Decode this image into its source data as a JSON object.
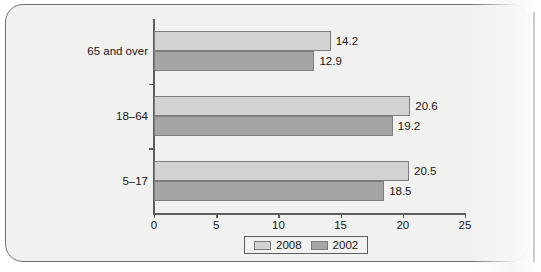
{
  "chart_data": {
    "type": "bar",
    "orientation": "horizontal",
    "title": "",
    "xlabel": "",
    "ylabel": "",
    "categories": [
      "65 and over",
      "18–64",
      "5–17"
    ],
    "series": [
      {
        "name": "2008",
        "values": [
          14.2,
          20.6,
          20.5
        ],
        "color": "#d2d2d0"
      },
      {
        "name": "2002",
        "values": [
          12.9,
          19.2,
          18.5
        ],
        "color": "#a5a5a3"
      }
    ],
    "xticks": [
      0,
      5,
      10,
      15,
      20,
      25
    ],
    "xtick_labels": [
      "0",
      "5",
      "10",
      "15",
      "20",
      "25"
    ],
    "xlim": [
      0,
      25
    ],
    "grid": false,
    "legend_position": "bottom-center",
    "data_labels": {
      "65 and over": {
        "2008": "14.2",
        "2002": "12.9"
      },
      "18–64": {
        "2008": "20.6",
        "2002": "19.2"
      },
      "5–17": {
        "2008": "20.5",
        "2002": "18.5"
      }
    }
  },
  "legend": {
    "items": [
      {
        "label": "2008",
        "color": "#d2d2d0"
      },
      {
        "label": "2002",
        "color": "#a5a5a3"
      }
    ]
  }
}
